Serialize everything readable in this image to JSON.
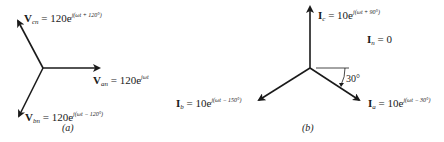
{
  "figure_a": {
    "caption": "(a)",
    "phasors": [
      {
        "id": "van",
        "symbol": "V",
        "subscript": "an",
        "magnitude": "120",
        "exponent": "jωt",
        "angle_deg": 0
      },
      {
        "id": "vbn",
        "symbol": "V",
        "subscript": "bn",
        "magnitude": "120",
        "exponent": "j(ωt − 120°)",
        "angle_deg": -120
      },
      {
        "id": "vcn",
        "symbol": "V",
        "subscript": "cn",
        "magnitude": "120",
        "exponent": "j(ωt + 120°)",
        "angle_deg": 120
      }
    ]
  },
  "figure_b": {
    "caption": "(b)",
    "neutral": {
      "symbol": "I",
      "subscript": "n",
      "value": "0"
    },
    "angle_annotation": "30°",
    "phasors": [
      {
        "id": "ia",
        "symbol": "I",
        "subscript": "a",
        "magnitude": "10",
        "exponent": "j(ωt − 30°)",
        "angle_deg": -30
      },
      {
        "id": "ib",
        "symbol": "I",
        "subscript": "b",
        "magnitude": "10",
        "exponent": "j(ωt − 150°)",
        "angle_deg": -150
      },
      {
        "id": "ic",
        "symbol": "I",
        "subscript": "c",
        "magnitude": "10",
        "exponent": "j(ωt + 90°)",
        "angle_deg": 90
      }
    ]
  },
  "text": {
    "equals": " = ",
    "e": "e"
  }
}
